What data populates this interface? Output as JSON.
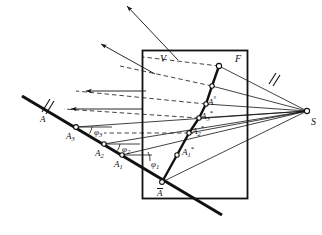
{
  "figure": {
    "type": "geometric-projection-diagram",
    "background_color": "#ffffff",
    "ink_color": "#111111",
    "canvas": {
      "width": 322,
      "height": 235
    },
    "labels": {
      "plane_V": "V",
      "plane_F": "F",
      "source_S": "S",
      "object_A": "A",
      "projected_A_bar": "A",
      "point_A3": "A",
      "point_A3_sub": "3",
      "point_A2": "A",
      "point_A2_sub": "2",
      "point_A1": "A",
      "point_A1_sub": "1",
      "image_A_star": "A",
      "image_A_star_sup": "°",
      "image_A3_star": "A",
      "image_A3_star_sub": "3",
      "image_A3_star_sup": "*",
      "image_A2_star": "A",
      "image_A2_star_sub": "2",
      "image_A2_star_sup": "*",
      "image_A1_star": "A",
      "image_A1_star_sub": "1",
      "image_A1_star_sup": "*",
      "angle_phi3": "φ",
      "angle_phi3_sub": "3",
      "angle_phi2": "φ",
      "angle_phi2_sub": "2",
      "angle_phi1": "φ",
      "angle_phi1_sub": "1"
    },
    "geometry": {
      "rect_plane": {
        "x": 142,
        "y": 50,
        "width": 106,
        "height": 149
      },
      "source_point": {
        "x": 307,
        "y": 111
      },
      "a_bar_point": {
        "x": 162,
        "y": 182
      },
      "chain_top_point": {
        "x": 219,
        "y": 66
      },
      "object_line": {
        "x1": 22,
        "y1": 96,
        "x2": 222,
        "y2": 215
      },
      "image_chain_points": [
        {
          "name": "A-bar",
          "x": 162,
          "y": 182
        },
        {
          "name": "A1-star",
          "x": 177,
          "y": 155
        },
        {
          "name": "A2-star",
          "x": 189,
          "y": 133
        },
        {
          "name": "A3-star",
          "x": 199,
          "y": 118
        },
        {
          "name": "A-star",
          "x": 206,
          "y": 104
        },
        {
          "name": "A-chain-top",
          "x": 219,
          "y": 66
        }
      ],
      "object_chain_points": [
        {
          "name": "A1",
          "x": 122,
          "y": 155
        },
        {
          "name": "A2",
          "x": 104,
          "y": 144
        },
        {
          "name": "A3",
          "x": 76,
          "y": 127
        }
      ],
      "incident_arrows": [
        {
          "x1": 172,
          "y1": 55,
          "x2": 127,
          "y2": 6
        },
        {
          "x1": 151,
          "y1": 73,
          "x2": 100,
          "y2": 44
        },
        {
          "x1": 144,
          "y1": 91,
          "x2": 86,
          "y2": 91
        },
        {
          "x1": 142,
          "y1": 109,
          "x2": 71,
          "y2": 109
        }
      ],
      "hatch_marks": [
        {
          "name": "object-line-tick",
          "x": 45,
          "y": 106
        },
        {
          "name": "fs-line-tick",
          "x": 272,
          "y": 78
        }
      ]
    }
  }
}
